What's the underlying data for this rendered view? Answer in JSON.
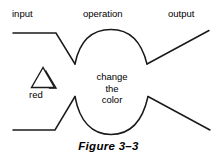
{
  "figure": {
    "caption": "Figure 3–3",
    "stroke_color": "#1a1a1a",
    "background_color": "#ffffff"
  },
  "labels": {
    "input": "input",
    "operation": "operation",
    "output": "output",
    "red": "red"
  },
  "center_text": {
    "line1": "change",
    "line2": "the",
    "line3": "color"
  },
  "icons": {
    "triangle": "triangle-outline-icon"
  },
  "diagram_geometry": {
    "upper_left_line": "M13,33 L56,33 L75,64",
    "upper_bulge": "M75,64 C80,40 92,30 110,30 C128,30 141,41 147,64",
    "upper_right_line": "M147,64 L209,31",
    "lower_left_line": "M13,130 L55,130 L75,97",
    "lower_bulge": "M75,97 C80,122 92,134 111,134 C129,134 142,122 148,97",
    "lower_right_line": "M148,97 L210,130",
    "triangle_points": "43,68 32,87 54,87",
    "triangle_shadow_points": "46,70 55,88 49,88"
  }
}
